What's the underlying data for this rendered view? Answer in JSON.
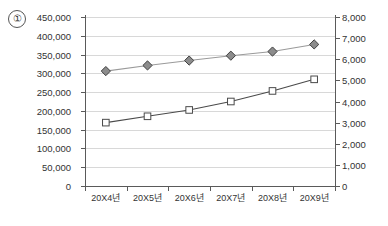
{
  "figure_label": "①",
  "chart_data": {
    "type": "line",
    "title": "",
    "subtitle": "",
    "xlabel": "",
    "ylabel": "",
    "grid": true,
    "legend_position": "none",
    "categories": [
      "20X4년",
      "20X5년",
      "20X6년",
      "20X7년",
      "20X8년",
      "20X9년"
    ],
    "axes": {
      "left": {
        "min": 0,
        "max": 450000,
        "step": 50000,
        "ticks": [
          0,
          50000,
          100000,
          150000,
          200000,
          250000,
          300000,
          350000,
          400000,
          450000
        ],
        "tick_labels": [
          "0",
          "50,000",
          "100,000",
          "150,000",
          "200,000",
          "250,000",
          "300,000",
          "350,000",
          "400,000",
          "450,000"
        ]
      },
      "right": {
        "min": 0,
        "max": 8000,
        "step": 1000,
        "ticks": [
          0,
          1000,
          2000,
          3000,
          4000,
          5000,
          6000,
          7000,
          8000
        ],
        "tick_labels": [
          "0",
          "1,000",
          "2,000",
          "3,000",
          "4,000",
          "5,000",
          "6,000",
          "7,000",
          "8,000"
        ]
      }
    },
    "series": [
      {
        "name": "series-diamond",
        "axis": "left",
        "marker": "diamond",
        "marker_fill": "#8c8c8c",
        "marker_stroke": "#3f3f3f",
        "line_color": "#9a9a9a",
        "values": [
          306000,
          321000,
          334000,
          347000,
          358000,
          377000
        ]
      },
      {
        "name": "series-square",
        "axis": "right",
        "marker": "square",
        "marker_fill": "#ffffff",
        "marker_stroke": "#4a4a4a",
        "line_color": "#4a4a4a",
        "values": [
          3000,
          3300,
          3600,
          4000,
          4500,
          5050
        ]
      }
    ]
  },
  "colors": {
    "grid": "#d8d8d8",
    "axis": "#5a5a5a",
    "text": "#333333",
    "background": "#ffffff"
  }
}
